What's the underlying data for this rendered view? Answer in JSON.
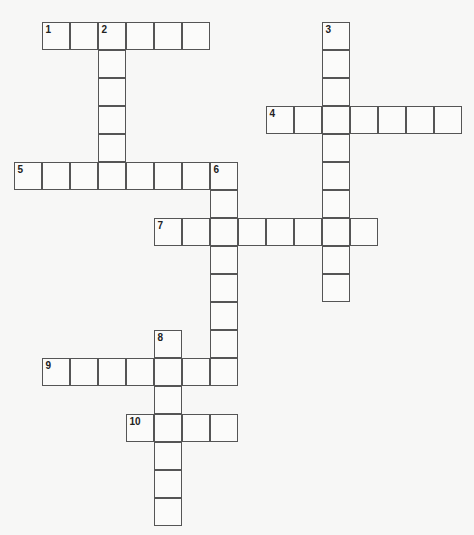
{
  "puzzle": {
    "cell_size": 28,
    "origin_x": 14,
    "origin_y": 22,
    "colors": {
      "border": "#555555",
      "background": "#f7f7f6",
      "cell": "#fbfbfa",
      "number": "#222222"
    },
    "words": [
      {
        "number": "1",
        "direction": "across",
        "row": 0,
        "col": 1,
        "length": 6
      },
      {
        "number": "2",
        "direction": "down",
        "row": 0,
        "col": 3,
        "length": 6
      },
      {
        "number": "3",
        "direction": "down",
        "row": 0,
        "col": 11,
        "length": 10
      },
      {
        "number": "4",
        "direction": "across",
        "row": 3,
        "col": 9,
        "length": 7
      },
      {
        "number": "5",
        "direction": "across",
        "row": 5,
        "col": 0,
        "length": 8
      },
      {
        "number": "6",
        "direction": "down",
        "row": 5,
        "col": 7,
        "length": 8
      },
      {
        "number": "7",
        "direction": "across",
        "row": 7,
        "col": 5,
        "length": 8
      },
      {
        "number": "8",
        "direction": "down",
        "row": 11,
        "col": 5,
        "length": 7
      },
      {
        "number": "9",
        "direction": "across",
        "row": 12,
        "col": 1,
        "length": 7
      },
      {
        "number": "10",
        "direction": "across",
        "row": 14,
        "col": 4,
        "length": 4
      }
    ]
  }
}
